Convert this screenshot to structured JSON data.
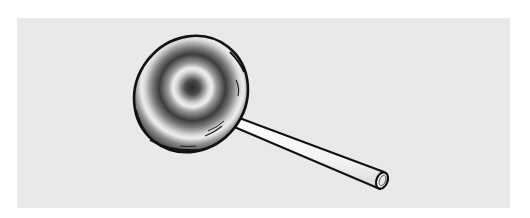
{
  "scene": {
    "description": "Illustration of a lollipop with concentric swirl rings on a round candy and a white stick",
    "background_color": "#ffffff",
    "panel_color": "#e9e9e9",
    "outline_color": "#111111",
    "stick_color": "#f7f7f7"
  },
  "objects": [
    {
      "name": "lollipop-candy",
      "shape": "ellipse",
      "style": "concentric grayscale rings"
    },
    {
      "name": "lollipop-stick",
      "shape": "tapered tube",
      "color": "#f7f7f7"
    }
  ]
}
